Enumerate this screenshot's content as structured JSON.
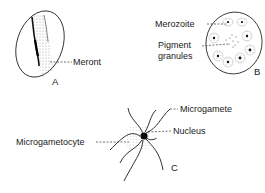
{
  "figure": {
    "panels": [
      {
        "id": "A",
        "letter": "A",
        "description": "Elongated parasite (meront) spanning an oval red blood cell",
        "labels": [
          {
            "text": "Meront"
          }
        ]
      },
      {
        "id": "B",
        "letter": "B",
        "description": "Round schizont containing merozoites and central pigment granules",
        "labels": [
          {
            "text": "Merozoite"
          },
          {
            "text": "Pigment"
          },
          {
            "text": "granules"
          }
        ]
      },
      {
        "id": "C",
        "letter": "C",
        "description": "Exflagellating microgametocyte with whip-like microgametes around a dark nucleus",
        "labels": [
          {
            "text": "Microgamete"
          },
          {
            "text": "Nucleus"
          },
          {
            "text": "Microgametocyte"
          }
        ]
      }
    ],
    "colors": {
      "ink": "#1a1a1a",
      "stipple": "#b5b5b5",
      "background": "#ffffff"
    }
  }
}
